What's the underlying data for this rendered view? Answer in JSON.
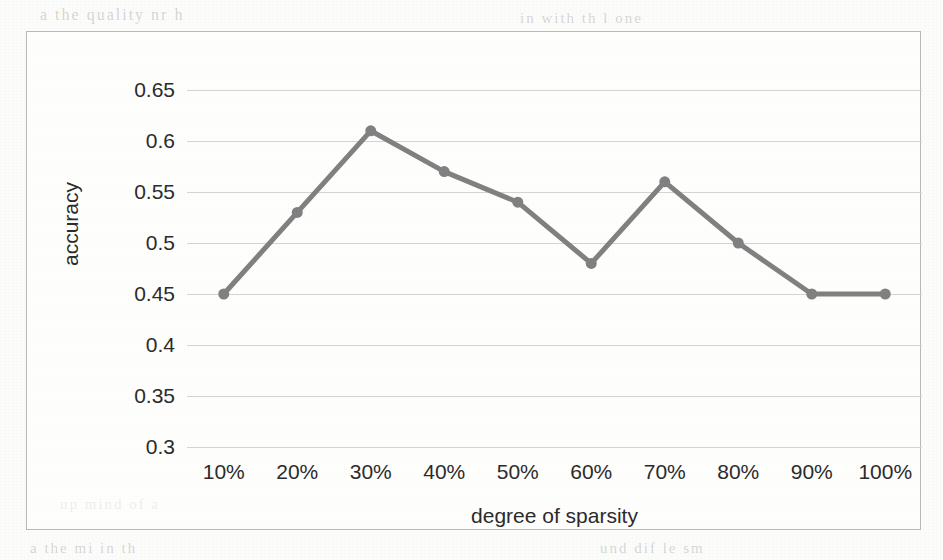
{
  "chart_data": {
    "type": "line",
    "title": "",
    "xlabel": "degree of sparsity",
    "ylabel": "accuracy",
    "categories": [
      "10%",
      "20%",
      "30%",
      "40%",
      "50%",
      "60%",
      "70%",
      "80%",
      "90%",
      "100%"
    ],
    "values": [
      0.45,
      0.53,
      0.61,
      0.57,
      0.54,
      0.48,
      0.56,
      0.5,
      0.45,
      0.45
    ],
    "ylim": [
      0.3,
      0.65
    ],
    "y_ticks": [
      0.65,
      0.6,
      0.55,
      0.5,
      0.45,
      0.4,
      0.35,
      0.3
    ],
    "y_tick_labels": [
      "0.65",
      "0.6",
      "0.55",
      "0.5",
      "0.45",
      "0.4",
      "0.35",
      "0.3"
    ],
    "grid": true,
    "legend": false,
    "legend_position": "none",
    "series": [
      {
        "name": "accuracy",
        "values": [
          0.45,
          0.53,
          0.61,
          0.57,
          0.54,
          0.48,
          0.56,
          0.5,
          0.45,
          0.45
        ],
        "color": "#808080",
        "marker": "circle",
        "line_width": 5,
        "marker_size": 11
      }
    ],
    "colors": {
      "series": "#808080",
      "gridline": "#d4d4d0",
      "frame": "#b9b9b4",
      "text": "#2b2b2b",
      "background": "#ffffff"
    }
  },
  "background": {
    "ghost_text": [
      "a  the  quality  nr  h",
      "in  with  th  l  one",
      "up  mind  of  a",
      "und  dif  le  sm",
      "a  the  mi  in  th"
    ]
  }
}
